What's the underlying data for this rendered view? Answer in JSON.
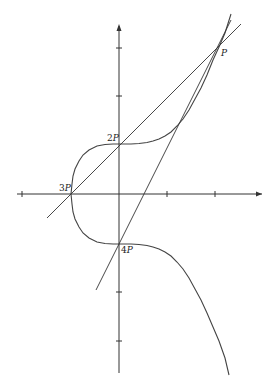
{
  "figure": {
    "title": "",
    "curve_equation": "y^2 = x^3 + 1",
    "points": [
      {
        "id": "P",
        "label": "P",
        "x": 2,
        "y": 3
      },
      {
        "id": "2P",
        "label": "2P",
        "x": 0,
        "y": 1
      },
      {
        "id": "3P",
        "label": "3P",
        "x": -1,
        "y": 0
      },
      {
        "id": "4P",
        "label": "4P",
        "x": 0,
        "y": -1
      }
    ],
    "lines": [
      {
        "name": "secant-line",
        "equation": "y = x + 1"
      },
      {
        "name": "tangent-line",
        "equation": "y = 2x - 1"
      }
    ],
    "axes": {
      "x_ticks": [
        -2,
        1,
        2
      ],
      "y_ticks": [
        3,
        2,
        -2,
        -3
      ]
    }
  },
  "labels": {
    "p_num": "",
    "p_var": "P",
    "p2_num": "2",
    "p2_var": "P",
    "p3_num": "3",
    "p3_var": "P",
    "p4_num": "4",
    "p4_var": "P"
  }
}
